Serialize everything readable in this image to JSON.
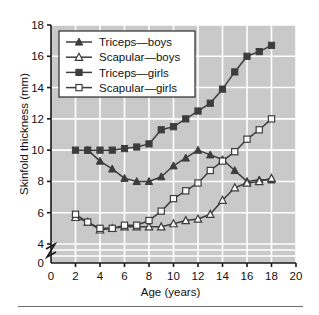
{
  "figure": {
    "x_axis_label": "Age (years)",
    "y_axis_label": "Skinfold thickness (mm)",
    "y_break_marker": "axis-break"
  },
  "chart_data": {
    "type": "line",
    "title": "",
    "xlabel": "Age (years)",
    "ylabel": "Skinfold thickness (mm)",
    "xlim": [
      0,
      20
    ],
    "ylim": [
      0,
      18
    ],
    "xticks": [
      0,
      2,
      4,
      6,
      8,
      10,
      12,
      14,
      16,
      18,
      20
    ],
    "yticks": [
      0,
      4,
      6,
      8,
      10,
      12,
      14,
      16,
      18
    ],
    "ytick_labels": [
      "0",
      "4",
      "6",
      "8",
      "10",
      "12",
      "14",
      "16",
      "18"
    ],
    "y_axis_break_between": [
      0,
      4
    ],
    "grid": true,
    "grid_color": "#ffffff",
    "plot_background": "#c9c9c9",
    "legend_position": "upper left",
    "series": [
      {
        "name": "Triceps—boys",
        "marker": "triangle-filled",
        "color": "#3d3d3d",
        "x": [
          3,
          4,
          5,
          6,
          7,
          8,
          9,
          10,
          11,
          12,
          13,
          14,
          15,
          16,
          17,
          18
        ],
        "values": [
          10.0,
          9.3,
          8.8,
          8.2,
          8.0,
          8.0,
          8.3,
          9.0,
          9.5,
          10.0,
          9.7,
          9.4,
          8.7,
          8.0,
          8.1,
          8.1
        ]
      },
      {
        "name": "Scapular—boys",
        "marker": "triangle-open",
        "color": "#3d3d3d",
        "x": [
          2,
          3,
          4,
          5,
          6,
          7,
          8,
          9,
          10,
          11,
          12,
          13,
          14,
          15,
          16,
          17,
          18
        ],
        "values": [
          5.7,
          5.4,
          4.9,
          5.0,
          5.1,
          5.1,
          5.1,
          5.1,
          5.3,
          5.5,
          5.6,
          5.9,
          6.8,
          7.6,
          7.9,
          8.0,
          8.2
        ]
      },
      {
        "name": "Triceps—girls",
        "marker": "square-filled",
        "color": "#3d3d3d",
        "x": [
          2,
          3,
          4,
          5,
          6,
          7,
          8,
          9,
          10,
          11,
          12,
          13,
          14,
          15,
          16,
          17,
          18
        ],
        "values": [
          10.0,
          10.0,
          10.0,
          10.0,
          10.1,
          10.2,
          10.4,
          11.3,
          11.5,
          12.0,
          12.5,
          13.0,
          13.9,
          15.0,
          16.0,
          16.3,
          16.7
        ]
      },
      {
        "name": "Scapular—girls",
        "marker": "square-open",
        "color": "#3d3d3d",
        "x": [
          2,
          3,
          4,
          5,
          6,
          7,
          8,
          9,
          10,
          11,
          12,
          13,
          14,
          15,
          16,
          17,
          18
        ],
        "values": [
          5.9,
          5.4,
          5.0,
          5.0,
          5.2,
          5.2,
          5.5,
          6.1,
          6.9,
          7.4,
          7.9,
          8.7,
          9.3,
          9.9,
          10.7,
          11.3,
          12.0
        ]
      }
    ]
  },
  "legend": {
    "entries": [
      {
        "label": "Triceps—boys",
        "marker": "triangle-filled"
      },
      {
        "label": "Scapular—boys",
        "marker": "triangle-open"
      },
      {
        "label": "Triceps—girls",
        "marker": "square-filled"
      },
      {
        "label": "Scapular—girls",
        "marker": "square-open"
      }
    ]
  }
}
